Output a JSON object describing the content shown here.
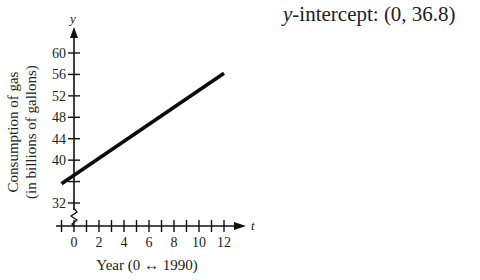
{
  "annotation": {
    "var": "y",
    "label": "-intercept: ",
    "value": "(0, 36.8)"
  },
  "chart_data": {
    "type": "line",
    "title": "",
    "xlabel": "Year (0 ↔ 1990)",
    "ylabel": "Consumption of gas (in billions of gallons)",
    "ylabel_lines": [
      "Consumption of gas",
      "(in billions of gallons)"
    ],
    "x_axis_var": "t",
    "y_axis_var": "y",
    "xlim": [
      -1,
      13
    ],
    "ylim": [
      28,
      62
    ],
    "x_ticks": [
      -1,
      0,
      1,
      2,
      3,
      4,
      5,
      6,
      7,
      8,
      9,
      10,
      11,
      12
    ],
    "x_tick_labels": [
      "0",
      "2",
      "4",
      "6",
      "8",
      "10",
      "12"
    ],
    "x_tick_label_values": [
      0,
      2,
      4,
      6,
      8,
      10,
      12
    ],
    "y_tick_labels": [
      "32",
      "40",
      "44",
      "48",
      "52",
      "56",
      "60"
    ],
    "y_tick_label_values": [
      32,
      40,
      44,
      48,
      52,
      56,
      60
    ],
    "y_unlabeled_ticks": [
      36
    ],
    "axis_break": true,
    "grid": false,
    "legend": null,
    "series": [
      {
        "name": "Gas consumption",
        "x": [
          -1,
          12
        ],
        "y": [
          35.6,
          56.2
        ],
        "description": "Straight line, slope ≈ 1.6, y-intercept 36.8"
      }
    ],
    "annotations": [
      "y-intercept: (0, 36.8)"
    ]
  }
}
